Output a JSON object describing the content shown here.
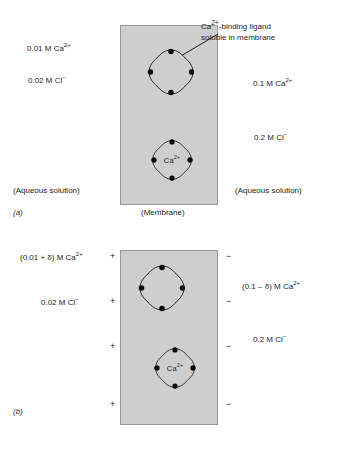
{
  "figure": {
    "panels": [
      {
        "id": "a",
        "caption": "(a)",
        "membrane_caption": "(Membrane)",
        "left": {
          "solution_caption": "(Aqueous solution)",
          "species": [
            {
              "text": "0.01 M Ca",
              "sup": "2+"
            },
            {
              "text": "0.02 M Cl",
              "sup": "−"
            }
          ]
        },
        "right": {
          "solution_caption": "(Aqueous solution)",
          "species": [
            {
              "text": "0.1 M Ca",
              "sup": "2+"
            },
            {
              "text": "0.2 M Cl",
              "sup": "−"
            }
          ]
        },
        "annotation": {
          "line1_text": "Ca",
          "line1_sup": "2+",
          "line1_rest": "-binding ligand",
          "line2": "soluble in membrane"
        },
        "ligands": [
          {
            "id": "ligand-a-top",
            "label": "",
            "label_sup": "",
            "filled": false
          },
          {
            "id": "ligand-a-bottom",
            "label": "Ca",
            "label_sup": "2+",
            "filled": true
          }
        ]
      },
      {
        "id": "b",
        "caption": "(b)",
        "membrane_caption": "",
        "left": {
          "solution_caption": "",
          "species": [
            {
              "text": "(0.01 + δ) M Ca",
              "sup": "2+"
            },
            {
              "text": "0.02 M Cl",
              "sup": "−"
            }
          ],
          "charge_sign": "+",
          "charge_count": 4
        },
        "right": {
          "solution_caption": "",
          "species": [
            {
              "text": "(0.1 – δ) M Ca",
              "sup": "2+"
            },
            {
              "text": "0.2 M Cl",
              "sup": "−"
            }
          ],
          "charge_sign": "−",
          "charge_count": 4
        },
        "ligands": [
          {
            "id": "ligand-b-top",
            "label": "",
            "label_sup": "",
            "filled": false
          },
          {
            "id": "ligand-b-bottom",
            "label": "Ca",
            "label_sup": "2+",
            "filled": true
          }
        ]
      }
    ],
    "colors": {
      "membrane_fill": "#cecece",
      "membrane_border": "#9a9a9a",
      "ink": "#1c1c1c"
    }
  }
}
